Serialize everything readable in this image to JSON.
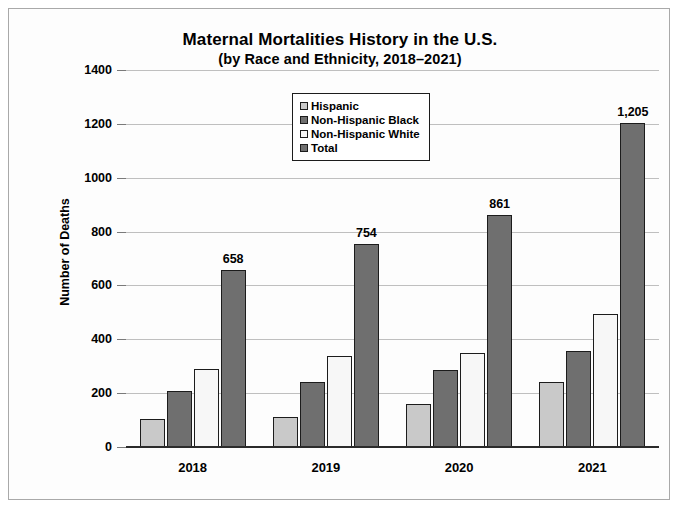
{
  "chart_data": {
    "type": "bar",
    "title": "Maternal Mortalities History in the U.S.",
    "subtitle": "(by Race and Ethnicity, 2018–2021)",
    "xlabel": "",
    "ylabel": "Number of Deaths",
    "categories": [
      "2018",
      "2019",
      "2020",
      "2021"
    ],
    "ylim": [
      0,
      1400
    ],
    "ytick_step": 200,
    "yticks": [
      "1400",
      "1200",
      "1000",
      "800",
      "600",
      "400",
      "200",
      "0"
    ],
    "grid": true,
    "legend_position": "top-center",
    "series": [
      {
        "name": "Hispanic",
        "color": "#c9c9c9",
        "values": [
          105,
          111,
          158,
          243
        ],
        "labels": [
          "",
          "",
          "",
          ""
        ]
      },
      {
        "name": "Non-Hispanic Black",
        "color": "#6f6f6f",
        "values": [
          207,
          241,
          287,
          357
        ],
        "labels": [
          "",
          "",
          "",
          ""
        ]
      },
      {
        "name": "Non-Hispanic White",
        "color": "#f7f7f7",
        "values": [
          289,
          339,
          348,
          493
        ],
        "labels": [
          "",
          "",
          "",
          ""
        ]
      },
      {
        "name": "Total",
        "color": "#6f6f6f",
        "values": [
          658,
          754,
          861,
          1205
        ],
        "labels": [
          "658",
          "754",
          "861",
          "1,205"
        ]
      }
    ]
  }
}
